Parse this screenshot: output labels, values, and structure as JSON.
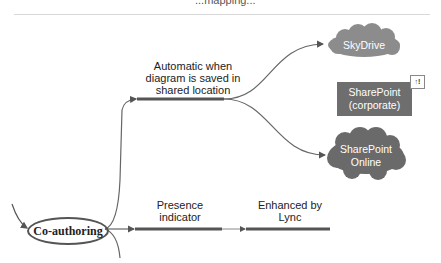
{
  "header": {
    "cut_title": "...mapping..."
  },
  "central_node": {
    "label": "Co-authoring"
  },
  "branches": [
    {
      "label": "Automatic when diagram is saved in shared location",
      "lines": [
        "Automatic when",
        "diagram is saved in",
        "shared location"
      ]
    },
    {
      "label": "Presence indicator",
      "lines": [
        "Presence",
        "indicator"
      ]
    },
    {
      "label": "Enhanced by Lync",
      "lines": [
        "Enhanced by",
        "Lync"
      ]
    }
  ],
  "targets": [
    {
      "label": "SkyDrive",
      "shape": "cloud",
      "color": "#8c8c8c"
    },
    {
      "label": "SharePoint (corporate)",
      "lines": [
        "SharePoint",
        "(corporate)"
      ],
      "shape": "rectangle",
      "color": "#6e6e6e",
      "badge": "↑!"
    },
    {
      "label": "SharePoint Online",
      "lines": [
        "SharePoint",
        "Online"
      ],
      "shape": "cloud",
      "color": "#6a6a6a"
    }
  ]
}
